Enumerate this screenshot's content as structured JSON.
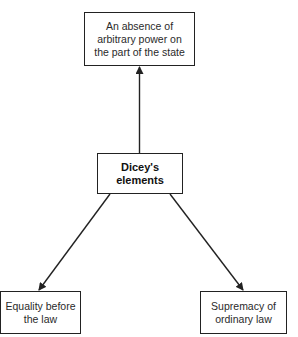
{
  "diagram": {
    "type": "concept-map",
    "center": {
      "label": "Dicey's elements"
    },
    "nodes": {
      "top": {
        "lines": [
          "An absence of",
          "arbitrary power on",
          "the part of the state"
        ]
      },
      "bottom_left": {
        "lines": [
          "Equality before",
          "the law"
        ]
      },
      "bottom_right": {
        "lines": [
          "Supremacy of",
          "ordinary law"
        ]
      }
    },
    "edges": [
      {
        "from": "center",
        "to": "top",
        "style": "arrow"
      },
      {
        "from": "center",
        "to": "bottom_left",
        "style": "arrow"
      },
      {
        "from": "center",
        "to": "bottom_right",
        "style": "arrow"
      }
    ],
    "colors": {
      "line": "#222222",
      "text": "#2a2a2a",
      "background": "#ffffff"
    }
  }
}
